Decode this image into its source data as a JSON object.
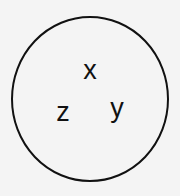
{
  "diagram": {
    "shape": "circle",
    "stroke_color": "#111111",
    "background_color": "#f4f4f4",
    "labels": {
      "top": "x",
      "left": "z",
      "right": "y"
    }
  }
}
